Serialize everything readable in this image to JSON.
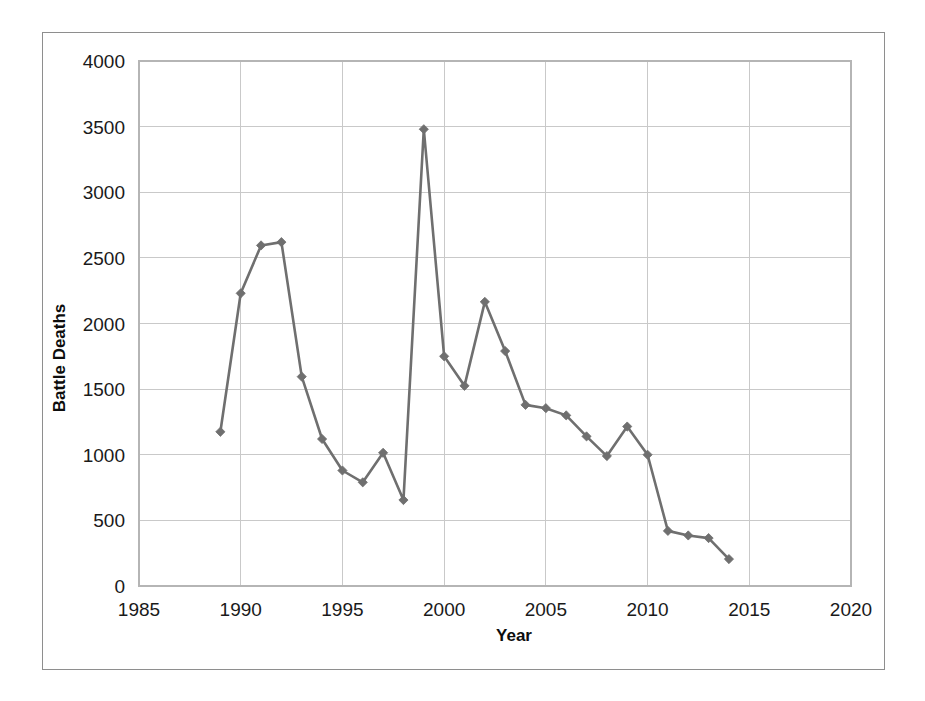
{
  "chart_data": {
    "type": "line",
    "title": "",
    "xlabel": "Year",
    "ylabel": "Battle Deaths",
    "xlim": [
      1985,
      2020
    ],
    "ylim": [
      0,
      4000
    ],
    "xticks": [
      "1985",
      "1990",
      "1995",
      "2000",
      "2005",
      "2010",
      "2015",
      "2020"
    ],
    "yticks": [
      "0",
      "500",
      "1000",
      "1500",
      "2000",
      "2500",
      "3000",
      "3500",
      "4000"
    ],
    "grid": "both",
    "legend": "none",
    "series_color": "#6f6f6f",
    "marker": "diamond",
    "x": [
      1989,
      1990,
      1991,
      1992,
      1993,
      1994,
      1995,
      1996,
      1997,
      1998,
      1999,
      2000,
      2001,
      2002,
      2003,
      2004,
      2005,
      2006,
      2007,
      2008,
      2009,
      2010,
      2011,
      2012,
      2013,
      2014
    ],
    "series": [
      {
        "name": "Battle Deaths",
        "values": [
          1175,
          2230,
          2595,
          2620,
          1595,
          1120,
          880,
          790,
          1015,
          655,
          3480,
          1750,
          1525,
          2165,
          1790,
          1380,
          1355,
          1300,
          1140,
          990,
          1215,
          1000,
          420,
          385,
          365,
          205
        ]
      }
    ]
  },
  "axes": {
    "x_title": "Year",
    "y_title": "Battle Deaths"
  },
  "colors": {
    "series": "#6f6f6f",
    "grid": "#c9c9c9",
    "frame": "#8e8e8e",
    "text": "#1a1a1a"
  }
}
